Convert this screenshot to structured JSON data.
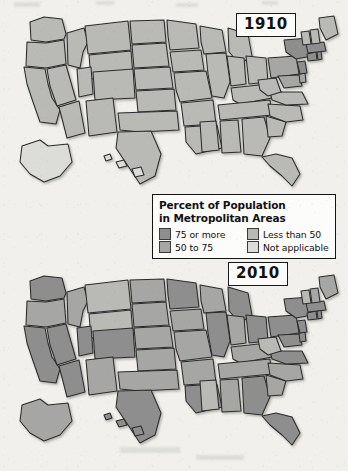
{
  "figure": {
    "title": "Percent of Population in Metropolitan Areas",
    "background_color": "#f1f0ed"
  },
  "legend": {
    "title_line1": "Percent of Population",
    "title_line2": "in Metropolitan Areas",
    "items": [
      {
        "label": "75 or more",
        "color": "#8e8e8e",
        "key": "p75plus"
      },
      {
        "label": "Less than 50",
        "color": "#b9b9b6",
        "key": "lt50"
      },
      {
        "label": "50 to 75",
        "color": "#a6a6a4",
        "key": "p50to75"
      },
      {
        "label": "Not applicable",
        "color": "#dcdcd8",
        "key": "na"
      }
    ],
    "border_color": "#141414",
    "box_color": "#fcfcfa"
  },
  "maps": [
    {
      "year": "1910",
      "name": "united-states-choropleth-1910"
    },
    {
      "year": "2010",
      "name": "united-states-choropleth-2010"
    }
  ],
  "chart_data": {
    "type": "map",
    "title": "Percent of Population in Metropolitan Areas",
    "subtype": "choropleth",
    "regions": "United States (50 states)",
    "classes": [
      {
        "label": "75 or more",
        "color": "#8e8e8e"
      },
      {
        "label": "50 to 75",
        "color": "#a6a6a4"
      },
      {
        "label": "Less than 50",
        "color": "#b9b9b6"
      },
      {
        "label": "Not applicable",
        "color": "#dcdcd8"
      }
    ],
    "panels": [
      {
        "year": "1910",
        "label": "1910",
        "state_classes": {
          "WA": "lt50",
          "OR": "lt50",
          "CA": "lt50",
          "NV": "lt50",
          "ID": "lt50",
          "MT": "lt50",
          "WY": "lt50",
          "UT": "lt50",
          "CO": "lt50",
          "AZ": "lt50",
          "NM": "lt50",
          "ND": "lt50",
          "SD": "lt50",
          "NE": "lt50",
          "KS": "lt50",
          "OK": "lt50",
          "TX": "lt50",
          "MN": "lt50",
          "IA": "lt50",
          "MO": "lt50",
          "AR": "lt50",
          "LA": "lt50",
          "WI": "lt50",
          "IL": "lt50",
          "MI": "lt50",
          "IN": "lt50",
          "OH": "lt50",
          "KY": "lt50",
          "TN": "lt50",
          "MS": "lt50",
          "AL": "lt50",
          "GA": "lt50",
          "FL": "lt50",
          "SC": "lt50",
          "NC": "lt50",
          "VA": "lt50",
          "WV": "lt50",
          "PA": "p50to75",
          "MD": "p50to75",
          "DE": "p50to75",
          "NJ": "p75plus",
          "NY": "p75plus",
          "CT": "p75plus",
          "RI": "p75plus",
          "MA": "p75plus",
          "VT": "lt50",
          "NH": "lt50",
          "ME": "lt50",
          "AK": "na",
          "HI": "na"
        }
      },
      {
        "year": "2010",
        "label": "2010",
        "state_classes": {
          "WA": "p75plus",
          "OR": "p50to75",
          "CA": "p75plus",
          "NV": "p75plus",
          "ID": "p50to75",
          "MT": "lt50",
          "WY": "lt50",
          "UT": "p75plus",
          "CO": "p75plus",
          "AZ": "p75plus",
          "NM": "p50to75",
          "ND": "p50to75",
          "SD": "p50to75",
          "NE": "p50to75",
          "KS": "p50to75",
          "OK": "p50to75",
          "TX": "p75plus",
          "MN": "p75plus",
          "IA": "p50to75",
          "MO": "p50to75",
          "AR": "p50to75",
          "LA": "p75plus",
          "WI": "p50to75",
          "IL": "p75plus",
          "MI": "p75plus",
          "IN": "p50to75",
          "OH": "p75plus",
          "KY": "p50to75",
          "TN": "p50to75",
          "MS": "lt50",
          "AL": "p50to75",
          "GA": "p75plus",
          "FL": "p75plus",
          "SC": "p50to75",
          "NC": "p50to75",
          "VA": "p75plus",
          "WV": "lt50",
          "PA": "p75plus",
          "MD": "p75plus",
          "DE": "p75plus",
          "NJ": "p75plus",
          "NY": "p75plus",
          "CT": "p75plus",
          "RI": "p75plus",
          "MA": "p75plus",
          "VT": "lt50",
          "NH": "p50to75",
          "ME": "p50to75",
          "AK": "p50to75",
          "HI": "p75plus"
        }
      }
    ]
  }
}
